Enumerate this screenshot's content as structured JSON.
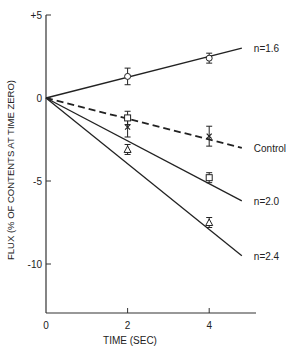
{
  "chart_data": {
    "type": "line",
    "title": "",
    "xlabel": "TIME (SEC)",
    "ylabel": "FLUX (% OF CONTENTS AT TIME ZERO)",
    "xlim": [
      0,
      5
    ],
    "ylim": [
      -13,
      5
    ],
    "x_ticks": [
      0,
      2,
      4
    ],
    "x_tick_labels": [
      "0",
      "2",
      "4"
    ],
    "y_ticks": [
      5,
      0,
      -5,
      -10
    ],
    "y_tick_labels": [
      "+5",
      "0",
      "-5",
      "-10"
    ],
    "grid": false,
    "legend_position": "inline labels at line ends (right)",
    "series": [
      {
        "name": "n=1.6",
        "marker": "circle",
        "line_style": "solid",
        "points": [
          {
            "x": 0,
            "y": 0
          },
          {
            "x": 2,
            "y": 1.3
          },
          {
            "x": 4,
            "y": 2.4
          }
        ],
        "error": [
          0,
          0.5,
          0.3
        ],
        "fit_end": {
          "x": 4.8,
          "y": 3.0
        }
      },
      {
        "name": "Control",
        "marker": "x",
        "line_style": "dashed",
        "points": [
          {
            "x": 0,
            "y": 0
          },
          {
            "x": 2,
            "y": -1.75
          },
          {
            "x": 4,
            "y": -2.3
          }
        ],
        "error": [
          0,
          0.6,
          0.6
        ],
        "fit_end": {
          "x": 4.8,
          "y": -3.0
        }
      },
      {
        "name": "n=2.0",
        "marker": "square",
        "line_style": "solid",
        "points": [
          {
            "x": 0,
            "y": 0
          },
          {
            "x": 2,
            "y": -1.2
          },
          {
            "x": 4,
            "y": -4.8
          }
        ],
        "error": [
          0,
          0.4,
          0.3
        ],
        "fit_end": {
          "x": 4.8,
          "y": -6.2
        }
      },
      {
        "name": "n=2.4",
        "marker": "triangle",
        "line_style": "solid",
        "points": [
          {
            "x": 0,
            "y": 0
          },
          {
            "x": 2,
            "y": -3.1
          },
          {
            "x": 4,
            "y": -7.5
          }
        ],
        "error": [
          0,
          0.3,
          0.3
        ],
        "fit_end": {
          "x": 4.8,
          "y": -9.5
        }
      }
    ]
  }
}
